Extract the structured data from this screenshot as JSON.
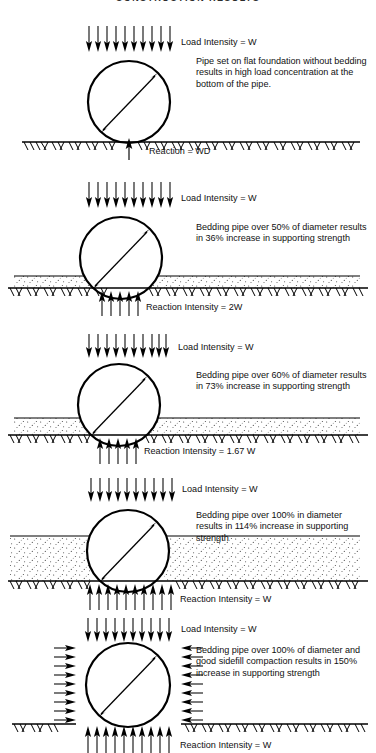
{
  "title": "CONSTRUCTION  RESULTS",
  "common": {
    "load_label": "Load Intensity  =  W",
    "diameter_label": "D"
  },
  "panels": [
    {
      "id": "panel-1-flat-foundation",
      "load_label": "Load Intensity  =  W",
      "description": "Pipe set on flat foundation without bedding results in high load concentration at the bottom of the pipe.",
      "reaction_label": "Reaction  =  WD",
      "bedding_percent": "0%",
      "strength_increase": "0%",
      "has_bedding_layer": false,
      "has_side_arrows": false,
      "reaction_arrow_count": 1,
      "load_arrow_count": 10
    },
    {
      "id": "panel-2-bedding-50",
      "load_label": "Load Intensity  =  W",
      "description": "Bedding pipe over 50% of diameter results in 36% increase in supporting strength",
      "reaction_label": "Reaction Intensity  =  2W",
      "bedding_percent": "50%",
      "strength_increase": "36%",
      "has_bedding_layer": true,
      "has_side_arrows": false,
      "reaction_arrow_count": 5,
      "load_arrow_count": 10
    },
    {
      "id": "panel-3-bedding-60",
      "load_label": "Load Intensity  =  W",
      "description": "Bedding pipe over 60% of diameter results in 73% increase in supporting strength",
      "reaction_label": "Reaction Intensity  =  1.67 W",
      "bedding_percent": "60%",
      "strength_increase": "73%",
      "has_bedding_layer": true,
      "has_side_arrows": false,
      "reaction_arrow_count": 5,
      "load_arrow_count": 10
    },
    {
      "id": "panel-4-bedding-100",
      "load_label": "Load Intensity  =  W",
      "description": "Bedding pipe over 100% in diameter results in 114% increase in supporting strength",
      "reaction_label": "Reaction Intensity  =  W",
      "bedding_percent": "100%",
      "strength_increase": "114%",
      "has_bedding_layer": true,
      "has_side_arrows": false,
      "reaction_arrow_count": 10,
      "load_arrow_count": 10
    },
    {
      "id": "panel-5-bedding-100-sidefill",
      "load_label": "Load Intensity  =  W",
      "description": "Bedding pipe over 100% of diameter and good sidefill compaction results in 150% increase in supporting strength",
      "reaction_label": "Reaction Intensity  =  W",
      "bedding_percent": "100%",
      "strength_increase": "150%",
      "has_bedding_layer": false,
      "has_side_arrows": true,
      "reaction_arrow_count": 10,
      "load_arrow_count": 10
    }
  ],
  "colors": {
    "ink": "#000000",
    "paper": "#ffffff",
    "stipple": "#4a4a4a",
    "title": "#2b2b2b"
  }
}
